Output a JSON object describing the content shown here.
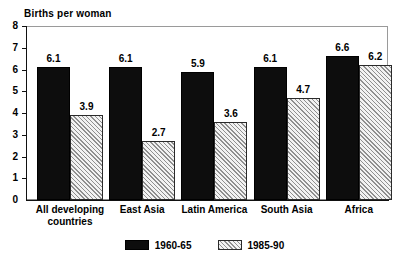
{
  "chart_data": {
    "type": "bar",
    "title": "Births per woman",
    "xlabel": "",
    "ylabel": "",
    "ylim": [
      0,
      8
    ],
    "yticks": [
      "0",
      "1",
      "2",
      "3",
      "4",
      "5",
      "6",
      "7",
      "8"
    ],
    "grid": false,
    "legend_position": "bottom-center",
    "categories": [
      "All developing\ncountries",
      "East Asia",
      "Latin America",
      "South Asia",
      "Africa"
    ],
    "series": [
      {
        "name": "1960-65",
        "color": "#0d0d0d",
        "fill": "solid-black",
        "values": [
          6.1,
          6.1,
          5.9,
          6.1,
          6.6
        ],
        "labels": [
          "6.1",
          "6.1",
          "5.9",
          "6.1",
          "6.6"
        ]
      },
      {
        "name": "1985-90",
        "color": "#f2f2f2",
        "fill": "diagonal-hatch",
        "values": [
          3.9,
          2.7,
          3.6,
          4.7,
          6.2
        ],
        "labels": [
          "3.9",
          "2.7",
          "3.6",
          "4.7",
          "6.2"
        ]
      }
    ]
  },
  "legend": {
    "items": [
      {
        "label": "1960-65",
        "swatch": "dark"
      },
      {
        "label": "1985-90",
        "swatch": "light"
      }
    ]
  }
}
